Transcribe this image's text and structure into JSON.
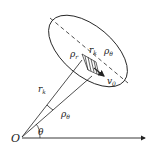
{
  "diagram": {
    "labels": {
      "origin": "O",
      "angle": "θ",
      "radius": "r",
      "radius_sub": "k",
      "rho_r": "ρ",
      "rho_r_sub": "r",
      "rk_top": "r",
      "rk_top_sub": "k",
      "rho_theta_top": "ρ",
      "rho_theta_top_sub": "θ",
      "rho_theta_bottom": "ρ",
      "rho_theta_bottom_sub": "θ",
      "velocity": "v",
      "velocity_sub": "0"
    },
    "colors": {
      "stroke": "#222222",
      "background": "#ffffff"
    }
  }
}
